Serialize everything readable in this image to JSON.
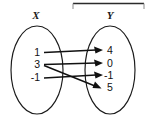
{
  "figure": {
    "type": "mapping-diagram",
    "domain_label": "X",
    "range_label": "Y",
    "domain_elements": [
      "1",
      "3",
      "-1"
    ],
    "range_elements": [
      "4",
      "0",
      "-1",
      "5"
    ],
    "mappings": [
      {
        "from": "1",
        "to": "4"
      },
      {
        "from": "3",
        "to": "0"
      },
      {
        "from": "3",
        "to": "5"
      },
      {
        "from": "-1",
        "to": "-1"
      }
    ],
    "arrow_count": "4",
    "colors": {
      "ink": "#111111",
      "outline": "#1a1a1a",
      "background": "#ffffff",
      "rule": "#2b2b2b"
    }
  }
}
